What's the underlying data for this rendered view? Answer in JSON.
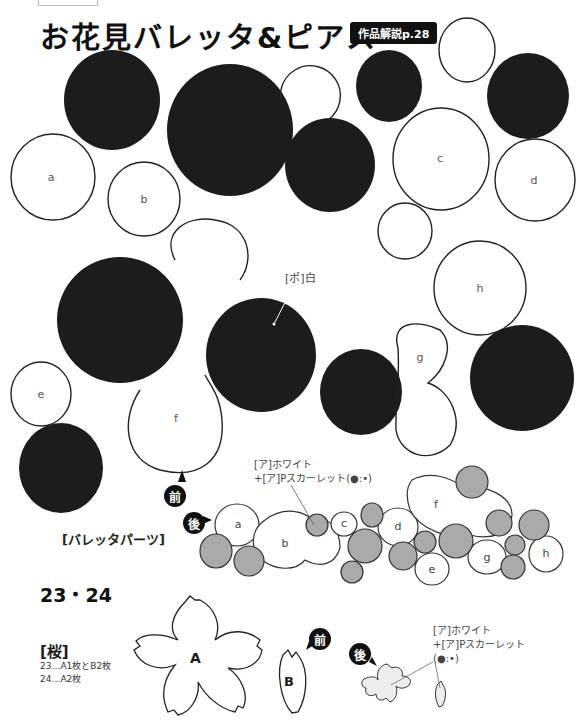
{
  "header": {
    "title": "お花見バレッタ&ピアス",
    "reference_badge": "作品解説p.28"
  },
  "pattern_pieces": {
    "circle_labels": [
      "a",
      "b",
      "c",
      "d",
      "e",
      "f",
      "g",
      "h"
    ],
    "annotation_pompom": "[ポ]白"
  },
  "assembly": {
    "front_label": "前",
    "back_label": "後",
    "yarn_line1": "[ア]ホワイト",
    "yarn_line2": "+[ア]Pスカーレット(●:•)",
    "section_title": "[バレッタパーツ]",
    "piece_labels": [
      "a",
      "b",
      "c",
      "d",
      "e",
      "f",
      "g",
      "h"
    ]
  },
  "sakura": {
    "model_numbers": "23・24",
    "heading": "[桜]",
    "line1": "23…A1枚とB2枚",
    "line2": "24…A2枚",
    "piece_a_label": "A",
    "piece_b_label": "B",
    "front_label": "前",
    "back_label": "後",
    "yarn_line1": "[ア]ホワイト",
    "yarn_line2": "+[ア]Pスカーレット",
    "yarn_line3": "(●:•)"
  },
  "colors": {
    "felt_black": "#1c1c1c",
    "outline": "#222222",
    "gray_fill": "#aaaaaa",
    "light_fill": "#eeeeee"
  }
}
